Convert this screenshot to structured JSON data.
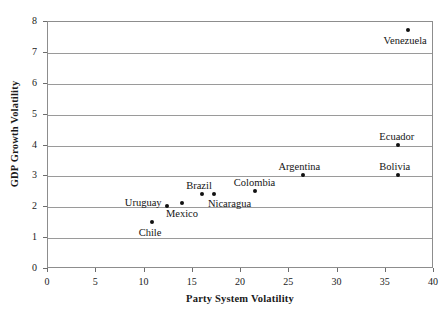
{
  "chart_data": {
    "type": "scatter",
    "title": "",
    "xlabel": "Party System Volatility",
    "ylabel": "GDP Growth Volatility",
    "xlim": [
      0,
      40
    ],
    "ylim": [
      0,
      8
    ],
    "xticks": [
      0,
      5,
      10,
      15,
      20,
      25,
      30,
      35,
      40
    ],
    "yticks": [
      0,
      1,
      2,
      3,
      4,
      5,
      6,
      7,
      8
    ],
    "grid": "horizontal",
    "legend": "none",
    "marker_color": "#111111",
    "axis_color": "#8d8d8d",
    "points": [
      {
        "label": "Chile",
        "x": 10.9,
        "y": 1.5,
        "label_pos": "below"
      },
      {
        "label": "Uruguay",
        "x": 12.4,
        "y": 2.0,
        "label_pos": "left"
      },
      {
        "label": "Mexico",
        "x": 14.0,
        "y": 2.1,
        "label_pos": "below"
      },
      {
        "label": "Brazil",
        "x": 16.1,
        "y": 2.4,
        "label_pos": "above"
      },
      {
        "label": "Nicaragua",
        "x": 17.3,
        "y": 2.4,
        "label_pos": "below-right"
      },
      {
        "label": "Colombia",
        "x": 21.6,
        "y": 2.5,
        "label_pos": "above"
      },
      {
        "label": "Argentina",
        "x": 26.5,
        "y": 3.0,
        "label_pos": "above"
      },
      {
        "label": "Bolivia",
        "x": 36.4,
        "y": 3.0,
        "label_pos": "above"
      },
      {
        "label": "Ecuador",
        "x": 36.4,
        "y": 4.0,
        "label_pos": "above"
      },
      {
        "label": "Venezuela",
        "x": 37.4,
        "y": 7.7,
        "label_pos": "below"
      }
    ]
  }
}
